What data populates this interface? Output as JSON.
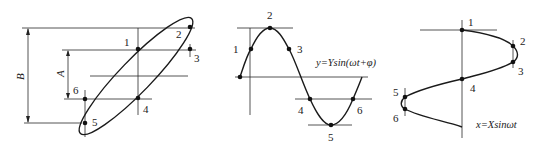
{
  "figure": {
    "left": {
      "title": "Lissajous ellipse",
      "dimension_labels": {
        "outer": "B",
        "inner": "A"
      },
      "point_labels": [
        "1",
        "2",
        "3",
        "4",
        "5",
        "6"
      ]
    },
    "middle": {
      "equation": "y=Ysin(ωt+φ)",
      "point_labels": [
        "1",
        "2",
        "3",
        "4",
        "5",
        "6"
      ]
    },
    "right": {
      "equation": "x=Xsinωt",
      "point_labels": [
        "1",
        "2",
        "3",
        "4",
        "5",
        "6"
      ]
    }
  }
}
